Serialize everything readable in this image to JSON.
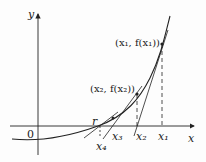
{
  "diagram": {
    "axes": {
      "x_label": "x",
      "y_label": "y",
      "origin_label": "0"
    },
    "points": {
      "p1_label": "(x₁, f(x₁))",
      "p2_label": "(x₂, f(x₂))"
    },
    "ticks": {
      "r": "r",
      "x1": "x₁",
      "x2": "x₂",
      "x3": "x₃",
      "x4": "x₄"
    },
    "colors": {
      "line": "#222222",
      "background": "#fdfdfd"
    }
  }
}
